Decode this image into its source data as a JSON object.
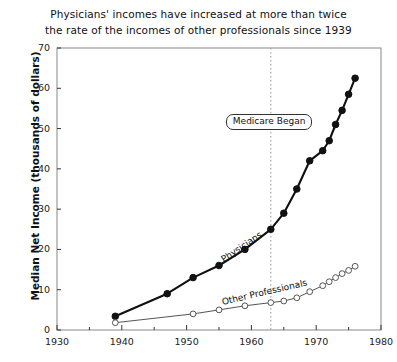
{
  "title": {
    "line1": "Physicians' incomes have increased at more than twice",
    "line2": "the rate of the incomes of other professionals since 1939"
  },
  "axes": {
    "ylabel": "Median Net Income (thousands of dollars)",
    "xlabel": "",
    "y_ticks": [
      "0",
      "10",
      "20",
      "30",
      "40",
      "50",
      "60",
      "70"
    ],
    "x_ticks": [
      "1930",
      "1940",
      "1950",
      "1960",
      "1970",
      "1980"
    ]
  },
  "annotations": {
    "medicare": "Medicare Began",
    "medicare_year": 1963,
    "series_label_physicians": "Physicians",
    "series_label_other": "Other Professionals"
  },
  "colors": {
    "physicians": "#111111",
    "other": "#555555",
    "frame": "#888888",
    "background": "#ffffff",
    "gridline": "#999999"
  },
  "chart_data": {
    "type": "line",
    "title": "Physicians' incomes have increased at more than twice the rate of the incomes of other professionals since 1939",
    "xlabel": "",
    "ylabel": "Median Net Income (thousands of dollars)",
    "xlim": [
      1930,
      1980
    ],
    "ylim": [
      0,
      70
    ],
    "grid": false,
    "legend": "inline-labels",
    "series": [
      {
        "name": "Physicians",
        "marker": "filled-circle",
        "x": [
          1939,
          1947,
          1951,
          1955,
          1959,
          1963,
          1965,
          1967,
          1969,
          1971,
          1972,
          1973,
          1974,
          1975,
          1976
        ],
        "values": [
          3.4,
          9.0,
          13.0,
          16.0,
          20.0,
          25.0,
          29.0,
          35.0,
          42.0,
          44.5,
          47.0,
          51.0,
          54.5,
          58.5,
          62.5
        ]
      },
      {
        "name": "Other Professionals",
        "marker": "open-circle",
        "x": [
          1939,
          1951,
          1955,
          1959,
          1963,
          1965,
          1967,
          1969,
          1971,
          1972,
          1973,
          1974,
          1975,
          1976
        ],
        "values": [
          1.8,
          4.0,
          5.0,
          6.0,
          6.8,
          7.2,
          8.0,
          9.5,
          11.0,
          12.0,
          13.0,
          14.0,
          14.8,
          15.8
        ]
      }
    ],
    "annotations": [
      {
        "text": "Medicare Began",
        "x": 1963,
        "type": "vertical-dotted-line-with-label"
      }
    ]
  }
}
